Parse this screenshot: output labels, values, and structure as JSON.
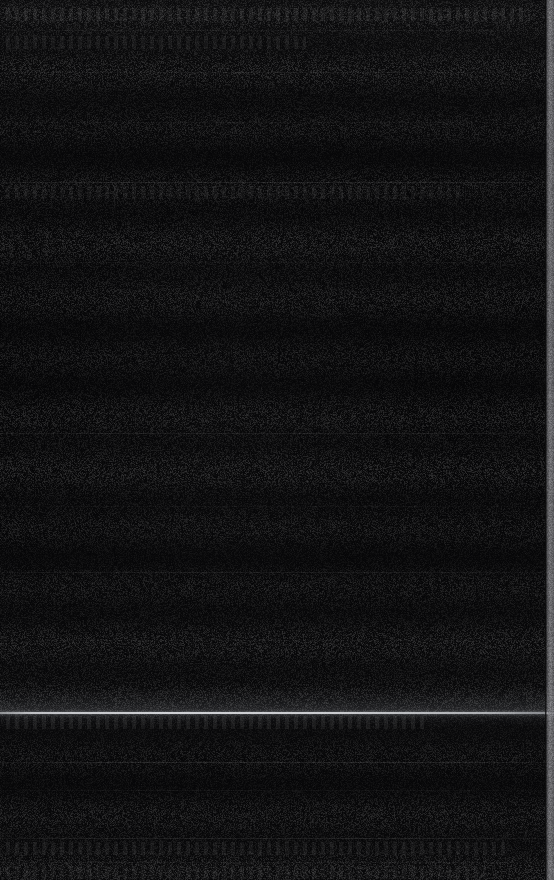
{
  "screen": {
    "name": "dark-screen-capture",
    "width": 554,
    "height": 880,
    "background_color": "#050505",
    "description": "Near-black underexposed screen capture"
  },
  "colors": {
    "background": "#050505",
    "field_light": "#0a0a0a",
    "field_dark": "#040404",
    "divider": "#171717",
    "scanline": "#eef0f4",
    "edge_strip": "#969698",
    "ghost_text": "#121212"
  },
  "edge_strip": {
    "label": "right-edge-strip",
    "x": 545,
    "width": 9,
    "color": "#969698"
  },
  "scanline": {
    "label": "bright-scan-line",
    "y": 712,
    "thickness": 2,
    "color": "#eef0f4",
    "glow_height": 26
  },
  "dividers": [
    {
      "label": "divider-1",
      "y": 30,
      "opacity": 0.04
    },
    {
      "label": "divider-2",
      "y": 72,
      "opacity": 0.045
    },
    {
      "label": "divider-3",
      "y": 122,
      "opacity": 0.028
    },
    {
      "label": "divider-4",
      "y": 182,
      "opacity": 0.07
    },
    {
      "label": "divider-5",
      "y": 262,
      "opacity": 0.022
    },
    {
      "label": "divider-6",
      "y": 433,
      "opacity": 0.055
    },
    {
      "label": "divider-7",
      "y": 506,
      "opacity": 0.024
    },
    {
      "label": "divider-8",
      "y": 572,
      "opacity": 0.05
    },
    {
      "label": "divider-9",
      "y": 640,
      "opacity": 0.022
    },
    {
      "label": "divider-10",
      "y": 762,
      "opacity": 0.085
    },
    {
      "label": "divider-11",
      "y": 790,
      "opacity": 0.03
    },
    {
      "label": "divider-12",
      "y": 838,
      "opacity": 0.075
    },
    {
      "label": "divider-13",
      "y": 862,
      "opacity": 0.04
    }
  ],
  "ghost_regions": [
    {
      "label": "ghost-row-top-left",
      "x": 6,
      "y": 36,
      "width": 300,
      "height": 13,
      "text": "",
      "opacity": 0.05
    },
    {
      "label": "ghost-row-header",
      "x": 6,
      "y": 8,
      "width": 520,
      "height": 13,
      "text": "",
      "opacity": 0.06
    },
    {
      "label": "ghost-row-mid",
      "x": 6,
      "y": 186,
      "width": 460,
      "height": 13,
      "text": "",
      "opacity": 0.04
    },
    {
      "label": "ghost-row-lower",
      "x": 6,
      "y": 716,
      "width": 420,
      "height": 13,
      "text": "",
      "opacity": 0.06
    },
    {
      "label": "ghost-row-bottom",
      "x": 6,
      "y": 842,
      "width": 500,
      "height": 13,
      "text": "",
      "opacity": 0.05
    },
    {
      "label": "ghost-row-bottom-2",
      "x": 6,
      "y": 866,
      "width": 480,
      "height": 13,
      "text": "",
      "opacity": 0.04
    }
  ]
}
